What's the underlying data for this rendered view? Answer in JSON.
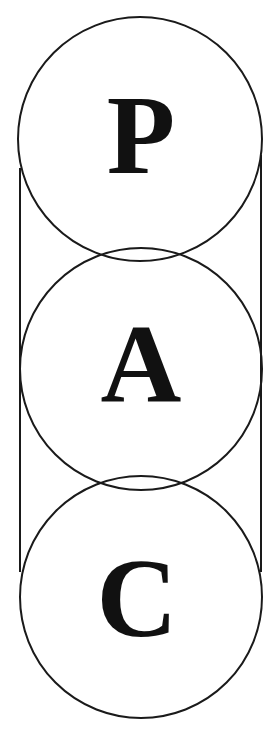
{
  "diagram": {
    "stroke_color": "#1a1a1a",
    "letter_color": "#111111",
    "background": "#ffffff",
    "circles": [
      {
        "label": "P",
        "cx": 140,
        "cy": 139,
        "r": 122
      },
      {
        "label": "A",
        "cx": 141,
        "cy": 369,
        "r": 121
      },
      {
        "label": "C",
        "cx": 141,
        "cy": 597,
        "r": 121
      }
    ],
    "side_lines": {
      "left": {
        "x": 20,
        "y1": 168,
        "y2": 572
      },
      "right": {
        "x": 261,
        "y1": 155,
        "y2": 572
      }
    }
  }
}
